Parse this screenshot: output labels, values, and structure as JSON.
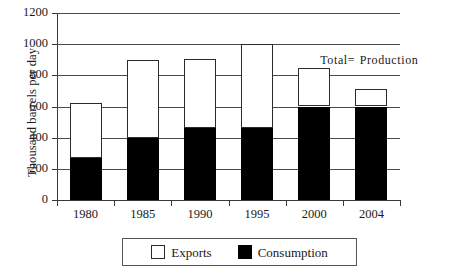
{
  "chart_data": {
    "type": "bar",
    "subtype": "stacked",
    "title": "",
    "xlabel": "",
    "ylabel": "Thousand barrels per day",
    "ylim": [
      0,
      1200
    ],
    "ytick_values": [
      0,
      200,
      400,
      600,
      800,
      1000,
      1200
    ],
    "ytick_labels": [
      "0",
      "200",
      "400",
      "600",
      "800",
      "1000",
      "1200"
    ],
    "grid": true,
    "grid_axis": "y",
    "categories": [
      "1980",
      "1985",
      "1990",
      "1995",
      "2000",
      "2004"
    ],
    "series": [
      {
        "name": "Consumption",
        "color": "#000000",
        "values": [
          270,
          400,
          460,
          460,
          600,
          600
        ]
      },
      {
        "name": "Exports",
        "color": "#ffffff",
        "values": [
          350,
          500,
          445,
          540,
          245,
          110
        ]
      }
    ],
    "totals": [
      620,
      900,
      905,
      1000,
      845,
      710
    ],
    "stack_order": [
      "Consumption",
      "Exports"
    ],
    "annotations": [
      {
        "text": "Total= Production",
        "x": "2000",
        "y": 900
      }
    ],
    "legend": {
      "position": "bottom",
      "entries": [
        {
          "label": "Exports",
          "swatch": "white-square"
        },
        {
          "label": "Consumption",
          "swatch": "black-square"
        }
      ]
    }
  },
  "axis": {
    "y_title": "Thousand barrels per day"
  }
}
